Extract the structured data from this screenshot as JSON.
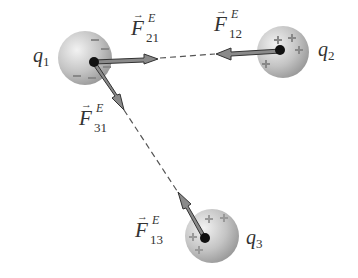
{
  "charges": [
    {
      "label": "q",
      "index": "1",
      "sign": "-"
    },
    {
      "label": "q",
      "index": "2",
      "sign": "+"
    },
    {
      "label": "q",
      "index": "3",
      "sign": "+"
    }
  ],
  "forces": [
    {
      "symbol": "F",
      "arrow": "→",
      "superscript": "E",
      "subscript": "21"
    },
    {
      "symbol": "F",
      "arrow": "→",
      "superscript": "E",
      "subscript": "12"
    },
    {
      "symbol": "F",
      "arrow": "→",
      "superscript": "E",
      "subscript": "31"
    },
    {
      "symbol": "F",
      "arrow": "→",
      "superscript": "E",
      "subscript": "13"
    }
  ],
  "colors": {
    "sphere": "#bdbdbd",
    "arrow_fill": "#8a8a8a",
    "arrow_stroke": "#333333",
    "dashed_line": "#555555"
  }
}
